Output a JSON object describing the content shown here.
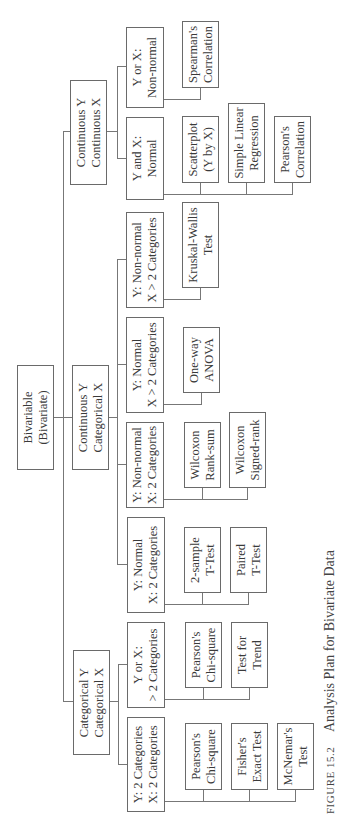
{
  "diagram": {
    "orientation": "rotated-90-ccw",
    "root": {
      "label": "Bivariable\n(Bivariate)"
    },
    "branches": [
      {
        "label": "Categorical Y\nCategorical X",
        "children": [
          {
            "label": "Y: 2 Categories\nX: 2 Categories",
            "tests": [
              "Pearson's\nChi-square",
              "Fisher's\nExact Test",
              "McNemar's\nTest"
            ]
          },
          {
            "label": "Y or X:\n> 2 Categories",
            "tests": [
              "Pearson's\nChi-square",
              "Test for\nTrend"
            ]
          }
        ]
      },
      {
        "label": "Continuous Y\nCategorical X",
        "children": [
          {
            "label": "Y: Normal\nX: 2 Categories",
            "tests": [
              "2-sample\nT-Test",
              "Paired\nT-Test"
            ]
          },
          {
            "label": "Y: Non-normal\nX: 2 Categories",
            "tests": [
              "Wilcoxon\nRank-sum",
              "Wilcoxon\nSigned-rank"
            ]
          },
          {
            "label": "Y: Normal\nX > 2 Categories",
            "tests": [
              "One-way\nANOVA"
            ]
          },
          {
            "label": "Y: Non-normal\nX > 2 Categories",
            "tests": [
              "Kruskal-Wallis\nTest"
            ]
          }
        ]
      },
      {
        "label": "Continuous Y\nContinuous X",
        "children": [
          {
            "label": "Y and X:\nNormal",
            "tests": [
              "Scatterplot\n(Y by X)",
              "Simple Linear\nRegression",
              "Pearson's\nCorrelation"
            ]
          },
          {
            "label": "Y or X:\nNon-normal",
            "tests": [
              "Spearman's\nCorrelation"
            ]
          }
        ]
      }
    ]
  },
  "caption": {
    "figure_number": "FIGURE 15.2",
    "title": "Analysis Plan for Bivariate Data"
  },
  "colors": {
    "line": "#777777",
    "border": "#6a6a6a",
    "text": "#3a3a3a",
    "background": "#ffffff"
  }
}
